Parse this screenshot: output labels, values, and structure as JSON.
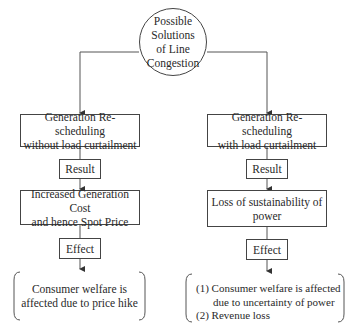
{
  "root": {
    "label_lines": [
      "Possible",
      "Solutions",
      "of Line",
      "Congestion"
    ]
  },
  "left_branch": {
    "method": [
      "Generation Re-scheduling",
      "without load curtailment"
    ],
    "result_label": "Result",
    "result": [
      "Increased Generation Cost",
      "and hence Spot Price"
    ],
    "effect_label": "Effect",
    "effect": [
      "Consumer welfare is",
      "affected due to price hike"
    ]
  },
  "right_branch": {
    "method": [
      "Generation Re-scheduling",
      "with load curtailment"
    ],
    "result_label": "Result",
    "result": [
      "Loss of sustainability of",
      "power"
    ],
    "effect_label": "Effect",
    "effect": [
      "(1) Consumer welfare is affected",
      "due to uncertainty of power",
      "(2) Revenue loss"
    ]
  }
}
